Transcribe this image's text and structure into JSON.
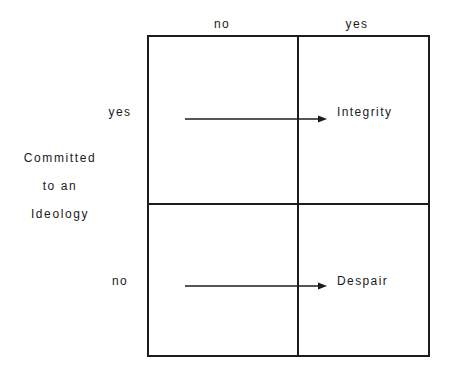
{
  "diagram": {
    "title_axis_left": {
      "lines": [
        "Committed",
        "to an",
        "Ideology"
      ]
    },
    "column_headers": {
      "left": "no",
      "right": "yes"
    },
    "row_labels": {
      "top": "yes",
      "bottom": "no"
    },
    "cells": {
      "top_right": "Integrity",
      "bottom_right": "Despair",
      "top_left": "",
      "bottom_left": ""
    },
    "arrows": {
      "top": {
        "name": "arrow-to-integrity",
        "direction": "right"
      },
      "bottom": {
        "name": "arrow-to-despair",
        "direction": "right"
      }
    },
    "colors": {
      "line": "#1c1c1c",
      "background": "#ffffff",
      "text": "#1a1a1a"
    }
  }
}
